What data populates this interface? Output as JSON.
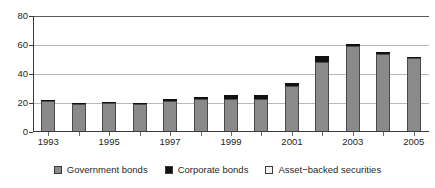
{
  "chart_data": {
    "type": "bar",
    "subtype": "stacked",
    "title": "",
    "subtitle": "",
    "xlabel": "",
    "ylabel": "",
    "ylim": [
      0,
      80
    ],
    "ytick_values": [
      0,
      20,
      40,
      60,
      80
    ],
    "ytick_labels": [
      "0",
      "20",
      "40",
      "60",
      "80"
    ],
    "grid": true,
    "grid_axis": "y",
    "legend_position": "bottom",
    "x": [
      1993,
      1994,
      1995,
      1996,
      1997,
      1998,
      1999,
      2000,
      2001,
      2002,
      2003,
      2004,
      2005
    ],
    "categories": [
      "1993",
      "1994",
      "1995",
      "1996",
      "1997",
      "1998",
      "1999",
      "2000",
      "2001",
      "2002",
      "2003",
      "2004",
      "2005"
    ],
    "xtick_labels": [
      "1993",
      "",
      "1995",
      "",
      "1997",
      "",
      "1999",
      "",
      "2001",
      "",
      "2003",
      "",
      "2005"
    ],
    "xtick_labels_shown": [
      "1993",
      "1995",
      "1997",
      "1999",
      "2001",
      "2003",
      "2005"
    ],
    "series": [
      {
        "name": "Government bonds",
        "color": "#8a8a8a",
        "values": [
          21.5,
          19.5,
          20.0,
          19.3,
          21.5,
          23.0,
          23.0,
          22.5,
          32.0,
          48.0,
          59.5,
          54.0,
          51.0
        ]
      },
      {
        "name": "Corporate bonds",
        "color": "#111111",
        "values": [
          0.3,
          0.3,
          0.4,
          0.8,
          1.0,
          1.3,
          2.3,
          2.7,
          2.0,
          4.5,
          1.0,
          1.3,
          0.7
        ]
      },
      {
        "name": "Asset-backed securities",
        "color": "#f2f2f2",
        "values": [
          0.0,
          0.0,
          0.0,
          0.0,
          0.0,
          0.0,
          0.0,
          0.0,
          0.0,
          0.0,
          0.0,
          0.0,
          0.0
        ]
      }
    ],
    "totals": [
      21.8,
      19.8,
      20.4,
      20.1,
      22.5,
      24.3,
      25.3,
      25.2,
      34.0,
      52.5,
      60.5,
      55.3,
      51.7
    ]
  },
  "legend": {
    "items": [
      {
        "label": "Government bonds",
        "color": "#8a8a8a",
        "swatch_name": "legend-swatch-government-bonds"
      },
      {
        "label": "Corporate bonds",
        "color": "#111111",
        "swatch_name": "legend-swatch-corporate-bonds"
      },
      {
        "label": "Asset−backed securities",
        "color": "#f2f2f2",
        "swatch_name": "legend-swatch-asset-backed-securities"
      }
    ]
  },
  "colors": {
    "government_bonds": "#8a8a8a",
    "corporate_bonds": "#111111",
    "asset_backed_securities": "#f2f2f2",
    "axis": "#3a3a3a",
    "gridline": "#b9b9b9",
    "background": "#ffffff",
    "text": "#1f1f1f"
  }
}
